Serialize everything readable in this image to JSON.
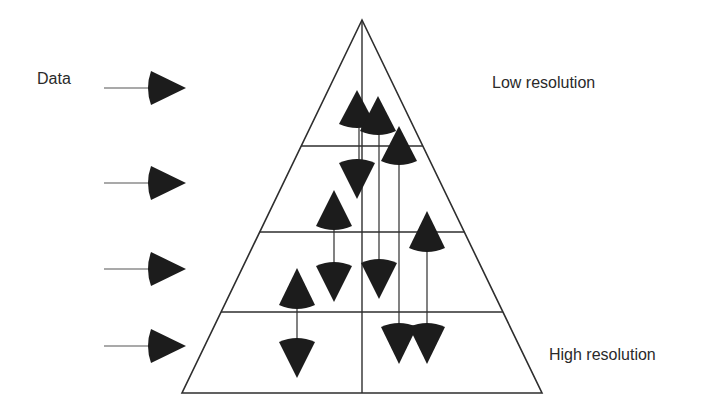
{
  "labels": {
    "data": "Data",
    "low_resolution": "Low resolution",
    "high_resolution": "High resolution"
  },
  "colors": {
    "line": "#2e2e2e",
    "fill": "#1c1c1c",
    "text": "#2a2a2a"
  },
  "pyramid": {
    "apex": [
      362,
      20
    ],
    "base_left": [
      182,
      393
    ],
    "base_right": [
      542,
      393
    ],
    "center_line_x": 362,
    "level_lines_y": [
      146,
      232,
      312,
      393
    ]
  },
  "input_arrows": [
    {
      "y": 88
    },
    {
      "y": 183
    },
    {
      "y": 269
    },
    {
      "y": 346
    }
  ],
  "cone_markers": [
    {
      "id": "up-1",
      "x": 357,
      "tip": 90,
      "base": 124,
      "dir": "up"
    },
    {
      "id": "up-2",
      "x": 378,
      "tip": 96,
      "base": 131,
      "dir": "up"
    },
    {
      "id": "up-3",
      "x": 399,
      "tip": 126,
      "base": 161,
      "dir": "up"
    },
    {
      "id": "down-1",
      "x": 357,
      "tip": 199,
      "base": 163,
      "dir": "down"
    },
    {
      "id": "up-4",
      "x": 334,
      "tip": 190,
      "base": 226,
      "dir": "up"
    },
    {
      "id": "up-5",
      "x": 427,
      "tip": 211,
      "base": 248,
      "dir": "up"
    },
    {
      "id": "down-2",
      "x": 334,
      "tip": 302,
      "base": 266,
      "dir": "down"
    },
    {
      "id": "down-3",
      "x": 379,
      "tip": 299,
      "base": 263,
      "dir": "down"
    },
    {
      "id": "up-6",
      "x": 297,
      "tip": 268,
      "base": 305,
      "dir": "up"
    },
    {
      "id": "down-4",
      "x": 399,
      "tip": 364,
      "base": 327,
      "dir": "down"
    },
    {
      "id": "down-5",
      "x": 427,
      "tip": 364,
      "base": 327,
      "dir": "down"
    },
    {
      "id": "down-6",
      "x": 297,
      "tip": 378,
      "base": 342,
      "dir": "down"
    }
  ],
  "connector_lines": [
    {
      "x": 359,
      "y1": 124,
      "y2": 163
    },
    {
      "x": 379,
      "y1": 131,
      "y2": 263
    },
    {
      "x": 399,
      "y1": 161,
      "y2": 327
    },
    {
      "x": 334,
      "y1": 226,
      "y2": 266
    },
    {
      "x": 427,
      "y1": 248,
      "y2": 327
    },
    {
      "x": 297,
      "y1": 305,
      "y2": 342
    }
  ]
}
